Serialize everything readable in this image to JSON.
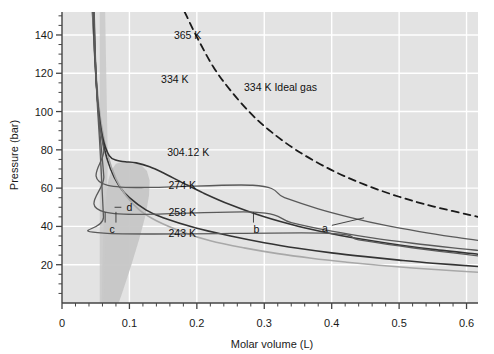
{
  "chart_data": {
    "type": "line",
    "title": "",
    "xlabel": "Molar volume (L)",
    "ylabel": "Pressure (bar)",
    "xlim": [
      0.0,
      0.617
    ],
    "ylim": [
      0.0,
      152
    ],
    "xticks": [
      0,
      0.1,
      0.2,
      0.3,
      0.4,
      0.5,
      0.6
    ],
    "xtick_labels": [
      "0",
      "0.1",
      "0.2",
      "0.3",
      "0.4",
      "0.5",
      "0.6"
    ],
    "xminor_step": 0.02,
    "yticks": [
      20,
      40,
      60,
      80,
      100,
      120,
      140
    ],
    "ytick_labels": [
      "20",
      "40",
      "60",
      "80",
      "100",
      "120",
      "140"
    ],
    "yminor_step": 5,
    "grid": "major white gridlines on gray panel",
    "legend": "inline curve labels",
    "plot_bg": "#dcdcdc",
    "panel_bg": "#e3e3e3",
    "dome_fill": "#c6c6c6",
    "grid_color": "#ffffff",
    "axis_color": "#444444",
    "series": [
      {
        "name": "365 K",
        "label": "365 K",
        "label_x": 0.166,
        "label_y": 140,
        "color": "#333333",
        "width": 1.6,
        "dash": "none",
        "T": 365,
        "points": [
          [
            0.0452,
            152
          ],
          [
            0.047,
            140
          ],
          [
            0.05,
            120
          ],
          [
            0.0545,
            100
          ],
          [
            0.062,
            82
          ],
          [
            0.072,
            70
          ],
          [
            0.085,
            61
          ],
          [
            0.1,
            55
          ],
          [
            0.125,
            48.5
          ],
          [
            0.15,
            44.5
          ],
          [
            0.2,
            39
          ],
          [
            0.25,
            35
          ],
          [
            0.3,
            31.5
          ],
          [
            0.35,
            28.6
          ],
          [
            0.4,
            26.2
          ],
          [
            0.45,
            24.2
          ],
          [
            0.5,
            22.4
          ],
          [
            0.55,
            20.8
          ],
          [
            0.617,
            19.1
          ]
        ]
      },
      {
        "name": "334 K",
        "label": "334 K",
        "label_x": 0.147,
        "label_y": 117,
        "color": "#a8a8a8",
        "width": 1.6,
        "dash": "none",
        "T": 334,
        "points": [
          [
            0.0455,
            152
          ],
          [
            0.048,
            135
          ],
          [
            0.052,
            113
          ],
          [
            0.058,
            94
          ],
          [
            0.068,
            77
          ],
          [
            0.08,
            65
          ],
          [
            0.095,
            56
          ],
          [
            0.115,
            48.5
          ],
          [
            0.14,
            43
          ],
          [
            0.18,
            37
          ],
          [
            0.22,
            32.5
          ],
          [
            0.27,
            28.8
          ],
          [
            0.32,
            25.8
          ],
          [
            0.37,
            23.4
          ],
          [
            0.42,
            21.4
          ],
          [
            0.47,
            19.7
          ],
          [
            0.52,
            18.3
          ],
          [
            0.57,
            17.1
          ],
          [
            0.617,
            16.1
          ]
        ]
      },
      {
        "name": "304.12 K",
        "label": "304.12 K",
        "label_x": 0.156,
        "label_y": 79,
        "color": "#333333",
        "width": 1.6,
        "dash": "none",
        "T": 304.12,
        "critical_point": [
          0.094,
          73.8
        ],
        "points": [
          [
            0.0462,
            152
          ],
          [
            0.049,
            128
          ],
          [
            0.053,
            105
          ],
          [
            0.06,
            87
          ],
          [
            0.07,
            77
          ],
          [
            0.082,
            74.4
          ],
          [
            0.094,
            73.8
          ],
          [
            0.11,
            73.2
          ],
          [
            0.13,
            71.2
          ],
          [
            0.15,
            68.0
          ],
          [
            0.18,
            62.6
          ],
          [
            0.21,
            57.4
          ],
          [
            0.25,
            51.3
          ],
          [
            0.3,
            45.0
          ],
          [
            0.35,
            40.1
          ],
          [
            0.4,
            36.2
          ],
          [
            0.45,
            33.0
          ],
          [
            0.5,
            30.3
          ],
          [
            0.55,
            28.0
          ],
          [
            0.617,
            25.5
          ]
        ]
      },
      {
        "name": "274 K",
        "label": "274 K",
        "label_x": 0.158,
        "label_y": 61.5,
        "color": "#5a5a5a",
        "width": 1.3,
        "dash": "none",
        "T": 274,
        "tieline_p": 61.5,
        "tieline_x": [
          0.068,
          0.283
        ],
        "points": [
          [
            0.047,
            152
          ],
          [
            0.05,
            122
          ],
          [
            0.0545,
            98
          ],
          [
            0.062,
            80
          ],
          [
            0.068,
            61.5
          ],
          [
            0.283,
            61.5
          ],
          [
            0.33,
            55.0
          ],
          [
            0.38,
            49.2
          ],
          [
            0.43,
            44.5
          ],
          [
            0.48,
            40.5
          ],
          [
            0.53,
            37.3
          ],
          [
            0.58,
            34.5
          ],
          [
            0.617,
            32.7
          ]
        ]
      },
      {
        "name": "258 K",
        "label": "258 K",
        "label_x": 0.158,
        "label_y": 47.5,
        "color": "#5a5a5a",
        "width": 1.3,
        "dash": "none",
        "T": 258,
        "tieline_p": 47.5,
        "tieline_x": [
          0.064,
          0.284
        ],
        "points": [
          [
            0.0473,
            152
          ],
          [
            0.0505,
            118
          ],
          [
            0.0555,
            92
          ],
          [
            0.062,
            66
          ],
          [
            0.064,
            47.5
          ],
          [
            0.284,
            47.5
          ],
          [
            0.34,
            42.0
          ],
          [
            0.4,
            37.5
          ],
          [
            0.46,
            34.0
          ],
          [
            0.52,
            31.2
          ],
          [
            0.58,
            28.8
          ],
          [
            0.617,
            27.5
          ]
        ]
      },
      {
        "name": "243 K",
        "label": "243 K",
        "label_x": 0.158,
        "label_y": 36.5,
        "color": "#5a5a5a",
        "width": 1.3,
        "dash": "none",
        "T": 243,
        "tieline_p": 36.5,
        "tieline_x": [
          0.062,
          0.385
        ],
        "points": [
          [
            0.0478,
            152
          ],
          [
            0.0512,
            112
          ],
          [
            0.0565,
            80
          ],
          [
            0.0615,
            45
          ],
          [
            0.062,
            36.5
          ],
          [
            0.385,
            36.5
          ],
          [
            0.44,
            33.0
          ],
          [
            0.5,
            29.8
          ],
          [
            0.56,
            27.0
          ],
          [
            0.617,
            24.6
          ]
        ]
      },
      {
        "name": "334 K Ideal gas",
        "label": "334 K Ideal gas",
        "label_x": 0.27,
        "label_y": 113,
        "color": "#1a1a1a",
        "width": 1.8,
        "dash": "7,5",
        "T": 334,
        "ideal": true,
        "points": [
          [
            0.182,
            152
          ],
          [
            0.2,
            139
          ],
          [
            0.225,
            123
          ],
          [
            0.25,
            111
          ],
          [
            0.28,
            99
          ],
          [
            0.31,
            89.5
          ],
          [
            0.35,
            79.3
          ],
          [
            0.4,
            69.4
          ],
          [
            0.45,
            61.7
          ],
          [
            0.5,
            55.5
          ],
          [
            0.55,
            50.5
          ],
          [
            0.617,
            45.0
          ]
        ]
      }
    ],
    "dome": {
      "name": "two-phase-dome",
      "fill": "#c6c6c6",
      "points": [
        [
          0.059,
          0
        ],
        [
          0.06,
          20
        ],
        [
          0.0612,
          36.5
        ],
        [
          0.0632,
          47.5
        ],
        [
          0.0668,
          61.5
        ],
        [
          0.074,
          70
        ],
        [
          0.084,
          73.4
        ],
        [
          0.094,
          73.8
        ],
        [
          0.106,
          73.4
        ],
        [
          0.118,
          72.0
        ],
        [
          0.118,
          72.0
        ],
        [
          0.106,
          73.4
        ],
        [
          0.094,
          73.8
        ]
      ]
    },
    "annotations": [
      {
        "name": "a",
        "label": "a",
        "label_x": 0.3855,
        "label_y": 39.0,
        "leader_to_x": 0.448,
        "leader_to_y": 44.5
      },
      {
        "name": "b",
        "label": "b",
        "label_x": 0.284,
        "label_y": 38.5,
        "tick_x": 0.284,
        "tick_top": 47.5,
        "tick_bottom": 42.0
      },
      {
        "name": "c",
        "label": "c",
        "label_x": 0.0705,
        "label_y": 38.5,
        "tick_x": 0.064,
        "tick_top": 47.5,
        "tick_bottom": 42.0
      },
      {
        "name": "d",
        "label": "d",
        "label_x": 0.0955,
        "label_y": 50.0,
        "leader_from_x": 0.078,
        "leader_to_x": 0.088,
        "leader_y": 50.0
      }
    ]
  },
  "figure": {
    "axis_title_x": "Molar volume (L)",
    "axis_title_y": "Pressure (bar)"
  }
}
